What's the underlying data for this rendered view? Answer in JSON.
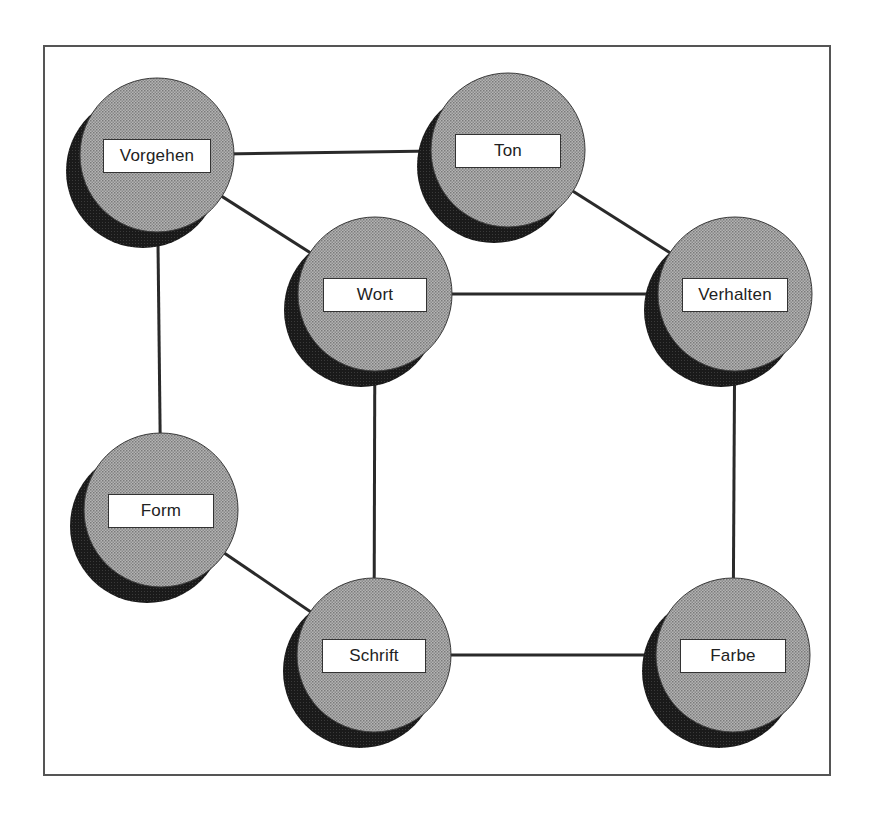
{
  "diagram": {
    "type": "network",
    "colors": {
      "frame": "#555555",
      "edge": "#2a2a2a",
      "node_fill": "#a8a8a8",
      "node_shadow": "#1e1e1e",
      "label_bg": "#ffffff",
      "label_text": "#222222"
    },
    "nodes": [
      {
        "id": "vorgehen",
        "label": "Vorgehen",
        "cx": 157,
        "cy": 155,
        "box_w": 108
      },
      {
        "id": "ton",
        "label": "Ton",
        "cx": 508,
        "cy": 150,
        "box_w": 106
      },
      {
        "id": "wort",
        "label": "Wort",
        "cx": 375,
        "cy": 294,
        "box_w": 104
      },
      {
        "id": "verhalten",
        "label": "Verhalten",
        "cx": 735,
        "cy": 294,
        "box_w": 106
      },
      {
        "id": "form",
        "label": "Form",
        "cx": 161,
        "cy": 510,
        "box_w": 106
      },
      {
        "id": "schrift",
        "label": "Schrift",
        "cx": 374,
        "cy": 655,
        "box_w": 104
      },
      {
        "id": "farbe",
        "label": "Farbe",
        "cx": 733,
        "cy": 655,
        "box_w": 106
      }
    ],
    "edges": [
      {
        "from": "vorgehen",
        "to": "ton"
      },
      {
        "from": "vorgehen",
        "to": "wort"
      },
      {
        "from": "vorgehen",
        "to": "form"
      },
      {
        "from": "ton",
        "to": "verhalten"
      },
      {
        "from": "wort",
        "to": "verhalten"
      },
      {
        "from": "wort",
        "to": "schrift"
      },
      {
        "from": "verhalten",
        "to": "farbe"
      },
      {
        "from": "form",
        "to": "schrift"
      },
      {
        "from": "schrift",
        "to": "farbe"
      }
    ]
  }
}
